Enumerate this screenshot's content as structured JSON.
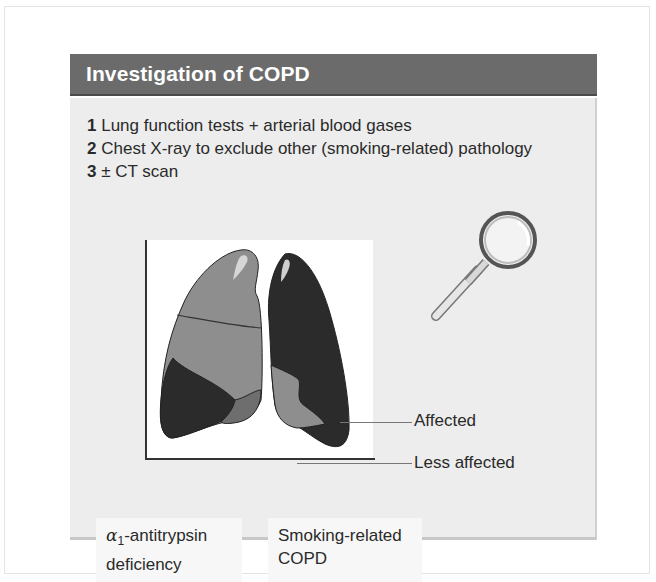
{
  "panel": {
    "title": "Investigation of COPD",
    "steps": [
      {
        "num": "1",
        "text": "Lung function tests + arterial blood gases"
      },
      {
        "num": "2",
        "text": "Chest X-ray to exclude other (smoking-related) pathology"
      },
      {
        "num": "3",
        "text": "± CT scan"
      }
    ]
  },
  "figure": {
    "callouts": {
      "affected": "Affected",
      "less_affected": "Less affected"
    },
    "captions": {
      "left": {
        "prefix": "α",
        "subscript": "1",
        "line1_rest": "-antitrypsin",
        "line2": "deficiency"
      },
      "right": {
        "line1": "Smoking-related",
        "line2": "COPD"
      }
    },
    "icons": {
      "magnifier": "magnifying-glass-icon",
      "lungs": "lungs-illustration"
    },
    "colors": {
      "header_bg": "#6b6b6b",
      "body_bg": "#ededed",
      "affected": "#2b2b2b",
      "less_affected": "#8e8e8e"
    }
  }
}
